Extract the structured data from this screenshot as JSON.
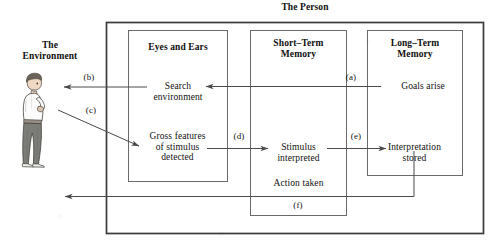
{
  "diagram": {
    "title": "The Person",
    "environment_label": "The\nEnvironment",
    "actor": {
      "name": "person-figure",
      "description": "standing person in profile holding an object"
    },
    "boxes": [
      {
        "id": "eyes-and-ears",
        "header": "Eyes and Ears",
        "nodes": [
          {
            "id": "search-environment",
            "text": "Search\nenvironment"
          },
          {
            "id": "gross-features",
            "text": "Gross features\nof stimulus\ndetected"
          }
        ]
      },
      {
        "id": "short-term-memory",
        "header": "Short–Term\nMemory",
        "nodes": [
          {
            "id": "stimulus-interpreted",
            "text": "Stimulus\ninterpreted"
          },
          {
            "id": "action-taken",
            "text": "Action taken"
          }
        ]
      },
      {
        "id": "long-term-memory",
        "header": "Long–Term\nMemory",
        "nodes": [
          {
            "id": "goals-arise",
            "text": "Goals arise"
          },
          {
            "id": "interpretation-stored",
            "text": "Interpretation\nstored"
          }
        ]
      }
    ],
    "arrow_labels": [
      {
        "id": "a",
        "text": "(a)"
      },
      {
        "id": "b",
        "text": "(b)"
      },
      {
        "id": "c",
        "text": "(c)"
      },
      {
        "id": "d",
        "text": "(d)"
      },
      {
        "id": "e",
        "text": "(e)"
      },
      {
        "id": "f",
        "text": "(f)"
      }
    ],
    "colors": {
      "line": "#4a4a4a",
      "outer_line": "#3a3a3a",
      "text": "#101010",
      "skin": "#efd9c4",
      "hair": "#6b6258",
      "shirt": "#fbfbfb",
      "trousers": "#7c7c78",
      "background": "#ffffff"
    }
  }
}
